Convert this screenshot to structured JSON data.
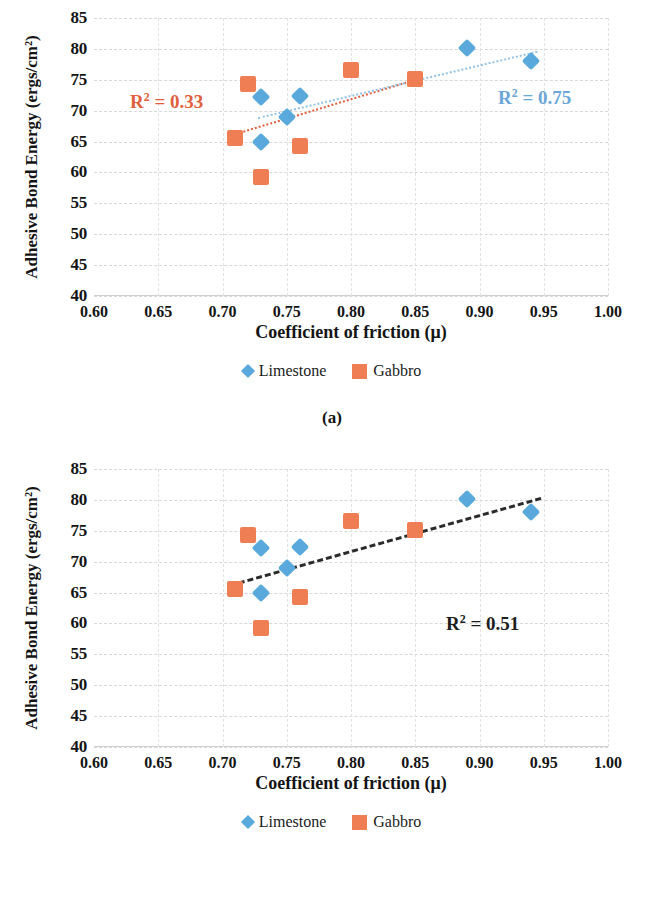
{
  "figure": {
    "panels": [
      {
        "caption": "(a)",
        "chart_data": {
          "type": "scatter",
          "title": "",
          "xlabel": "Coefficient of friction (μ)",
          "ylabel": "Adhesive Bond Energy (ergs/cm²)",
          "xlim": [
            0.6,
            1.0
          ],
          "ylim": [
            40,
            85
          ],
          "xticks": [
            "0.60",
            "0.65",
            "0.70",
            "0.75",
            "0.80",
            "0.85",
            "0.90",
            "0.95",
            "1.00"
          ],
          "xtick_values": [
            0.6,
            0.65,
            0.7,
            0.75,
            0.8,
            0.85,
            0.9,
            0.95,
            1.0
          ],
          "yticks": [
            "40",
            "45",
            "50",
            "55",
            "60",
            "65",
            "70",
            "75",
            "80",
            "85"
          ],
          "ytick_values": [
            40,
            45,
            50,
            55,
            60,
            65,
            70,
            75,
            80,
            85
          ],
          "grid": true,
          "legend_position": "bottom",
          "series": [
            {
              "name": "Limestone",
              "marker": "diamond",
              "color": "#59a9dd",
              "points": [
                {
                  "x": 0.73,
                  "y": 72.2
                },
                {
                  "x": 0.73,
                  "y": 65.0
                },
                {
                  "x": 0.75,
                  "y": 69.0
                },
                {
                  "x": 0.76,
                  "y": 72.3
                },
                {
                  "x": 0.89,
                  "y": 80.1
                },
                {
                  "x": 0.94,
                  "y": 78.1
                }
              ]
            },
            {
              "name": "Gabbro",
              "marker": "square",
              "color": "#ef7e54",
              "points": [
                {
                  "x": 0.71,
                  "y": 65.6
                },
                {
                  "x": 0.72,
                  "y": 74.3
                },
                {
                  "x": 0.73,
                  "y": 59.3
                },
                {
                  "x": 0.76,
                  "y": 64.2
                },
                {
                  "x": 0.8,
                  "y": 76.6
                },
                {
                  "x": 0.85,
                  "y": 75.1
                }
              ]
            }
          ],
          "trendlines": [
            {
              "name": "Gabbro trendline",
              "color": "#e0603d",
              "style": "dotted",
              "x0": 0.705,
              "y0": 66.0,
              "x1": 0.855,
              "y1": 75.4,
              "r2_label": "R² = 0.33",
              "r2_value": 0.33
            },
            {
              "name": "Limestone trendline",
              "color": "#93c2e6",
              "style": "dotted",
              "x0": 0.728,
              "y0": 68.9,
              "x1": 0.945,
              "y1": 79.6,
              "r2_label": "R² = 0.75",
              "r2_value": 0.75
            }
          ],
          "annotations": [
            {
              "text_r": "R",
              "text_sup": "2",
              "text_rest": " = 0.33",
              "color": "#e0603d"
            },
            {
              "text_r": "R",
              "text_sup": "2",
              "text_rest": " = 0.75",
              "color": "#6ca6d8"
            }
          ]
        }
      },
      {
        "caption": "(b)",
        "chart_data": {
          "type": "scatter",
          "title": "",
          "xlabel": "Coefficient of friction (μ)",
          "ylabel": "Adhesive Bond Energy (ergs/cm²)",
          "xlim": [
            0.6,
            1.0
          ],
          "ylim": [
            40,
            85
          ],
          "xticks": [
            "0.60",
            "0.65",
            "0.70",
            "0.75",
            "0.80",
            "0.85",
            "0.90",
            "0.95",
            "1.00"
          ],
          "xtick_values": [
            0.6,
            0.65,
            0.7,
            0.75,
            0.8,
            0.85,
            0.9,
            0.95,
            1.0
          ],
          "yticks": [
            "40",
            "45",
            "50",
            "55",
            "60",
            "65",
            "70",
            "75",
            "80",
            "85"
          ],
          "ytick_values": [
            40,
            45,
            50,
            55,
            60,
            65,
            70,
            75,
            80,
            85
          ],
          "grid": true,
          "legend_position": "bottom",
          "series": [
            {
              "name": "Limestone",
              "marker": "diamond",
              "color": "#59a9dd",
              "points": [
                {
                  "x": 0.73,
                  "y": 72.2
                },
                {
                  "x": 0.73,
                  "y": 65.0
                },
                {
                  "x": 0.75,
                  "y": 69.0
                },
                {
                  "x": 0.76,
                  "y": 72.3
                },
                {
                  "x": 0.89,
                  "y": 80.1
                },
                {
                  "x": 0.94,
                  "y": 78.1
                }
              ]
            },
            {
              "name": "Gabbro",
              "marker": "square",
              "color": "#ef7e54",
              "points": [
                {
                  "x": 0.71,
                  "y": 65.6
                },
                {
                  "x": 0.72,
                  "y": 74.3
                },
                {
                  "x": 0.73,
                  "y": 59.3
                },
                {
                  "x": 0.76,
                  "y": 64.2
                },
                {
                  "x": 0.8,
                  "y": 76.6
                },
                {
                  "x": 0.85,
                  "y": 75.1
                }
              ]
            }
          ],
          "trendlines": [
            {
              "name": "Combined trendline",
              "color": "#2b2b2b",
              "style": "dashed",
              "x0": 0.706,
              "y0": 66.4,
              "x1": 0.948,
              "y1": 80.5,
              "r2_label": "R² = 0.51",
              "r2_value": 0.51
            }
          ],
          "annotations": [
            {
              "text_r": "R",
              "text_sup": "2",
              "text_rest": " = 0.51",
              "color": "#1d1d1d"
            }
          ]
        }
      }
    ],
    "legend": {
      "items": [
        {
          "label": "Limestone",
          "marker": "diamond",
          "color": "#59a9dd"
        },
        {
          "label": "Gabbro",
          "marker": "square",
          "color": "#ef7e54"
        }
      ]
    },
    "colors": {
      "limestone": "#59a9dd",
      "gabbro": "#ef7e54",
      "trend_orange": "#e0603d",
      "trend_blue": "#93c2e6",
      "trend_black": "#2b2b2b"
    }
  }
}
